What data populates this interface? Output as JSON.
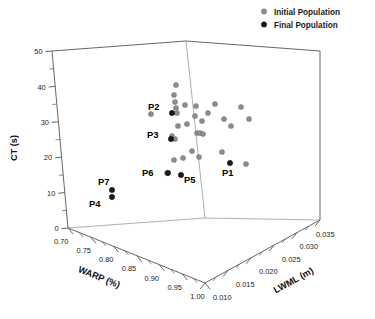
{
  "chart_data": {
    "type": "scatter",
    "projection": "3d",
    "title": "",
    "xlabel": "WARP (%)",
    "ylabel": "LWML (m)",
    "zlabel": "CT (s)",
    "axes": {
      "warp": {
        "label": "WARP (%)",
        "min": 0.7,
        "max": 1.0,
        "ticks": [
          "0.70",
          "0.75",
          "0.80",
          "0.85",
          "0.90",
          "0.95",
          "1.00"
        ],
        "tick_values": [
          0.7,
          0.75,
          0.8,
          0.85,
          0.9,
          0.95,
          1.0
        ],
        "minor_per_major": 2
      },
      "lwml": {
        "label": "LWML (m)",
        "min": 0.01,
        "max": 0.035,
        "ticks": [
          "0.010",
          "0.015",
          "0.020",
          "0.025",
          "0.030",
          "0.035"
        ],
        "tick_values": [
          0.01,
          0.015,
          0.02,
          0.025,
          0.03,
          0.035
        ],
        "minor_per_major": 2
      },
      "ct": {
        "label": "CT (s)",
        "min": 0,
        "max": 50,
        "ticks": [
          "0",
          "10",
          "20",
          "30",
          "40",
          "50"
        ],
        "tick_values": [
          0,
          10,
          20,
          30,
          40,
          50
        ],
        "minor_per_major": 2
      }
    },
    "grid": false,
    "legend": {
      "position": "top-right",
      "entries": [
        {
          "label": "Initial Population",
          "color": "#8c8c8c",
          "marker": "circle"
        },
        {
          "label": "Final Population",
          "color": "#1a1a1a",
          "marker": "circle"
        }
      ]
    },
    "series": [
      {
        "name": "Initial Population",
        "color": "#8c8c8c",
        "points": [
          {
            "px": 176,
            "py": 85
          },
          {
            "px": 174,
            "py": 95
          },
          {
            "px": 175,
            "py": 102
          },
          {
            "px": 176,
            "py": 108
          },
          {
            "px": 177,
            "py": 113
          },
          {
            "px": 151,
            "py": 114
          },
          {
            "px": 185,
            "py": 105
          },
          {
            "px": 196,
            "py": 106
          },
          {
            "px": 215,
            "py": 104
          },
          {
            "px": 241,
            "py": 107
          },
          {
            "px": 195,
            "py": 116
          },
          {
            "px": 208,
            "py": 113
          },
          {
            "px": 224,
            "py": 119
          },
          {
            "px": 249,
            "py": 119
          },
          {
            "px": 187,
            "py": 124
          },
          {
            "px": 202,
            "py": 121
          },
          {
            "px": 178,
            "py": 126
          },
          {
            "px": 172,
            "py": 136
          },
          {
            "px": 197,
            "py": 133
          },
          {
            "px": 200,
            "py": 133
          },
          {
            "px": 203,
            "py": 134
          },
          {
            "px": 231,
            "py": 126
          },
          {
            "px": 175,
            "py": 139
          },
          {
            "px": 192,
            "py": 151
          },
          {
            "px": 199,
            "py": 157
          },
          {
            "px": 222,
            "py": 152
          },
          {
            "px": 183,
            "py": 158
          },
          {
            "px": 246,
            "py": 164
          },
          {
            "px": 174,
            "py": 160
          },
          {
            "px": 167,
            "py": 173
          }
        ]
      },
      {
        "name": "Final Population",
        "color": "#1a1a1a",
        "points": [
          {
            "px": 172,
            "py": 113,
            "label": "P2",
            "label_dx": -24,
            "label_dy": -3
          },
          {
            "px": 171,
            "py": 139,
            "label": "P3",
            "label_dx": -24,
            "label_dy": -1
          },
          {
            "px": 168,
            "py": 173,
            "label": "P6",
            "label_dx": -26,
            "label_dy": 3
          },
          {
            "px": 181,
            "py": 175,
            "label": "P5",
            "label_dx": 3,
            "label_dy": 8
          },
          {
            "px": 230,
            "py": 163,
            "label": "P1",
            "label_dx": -8,
            "label_dy": 13
          },
          {
            "px": 112,
            "py": 190,
            "label": "P7",
            "label_dx": -14,
            "label_dy": -5
          },
          {
            "px": 112,
            "py": 197,
            "label": "P4",
            "label_dx": -23,
            "label_dy": 10
          }
        ]
      }
    ]
  },
  "geometry": {
    "origin_corner": {
      "x": 68,
      "y": 228
    },
    "top_left": {
      "x": 52,
      "y": 51
    },
    "front_bottom": {
      "x": 205,
      "y": 283
    },
    "back_top": {
      "x": 186,
      "y": 41
    },
    "right_bottom": {
      "x": 320,
      "y": 220
    },
    "right_top": {
      "x": 320,
      "y": 51
    }
  }
}
